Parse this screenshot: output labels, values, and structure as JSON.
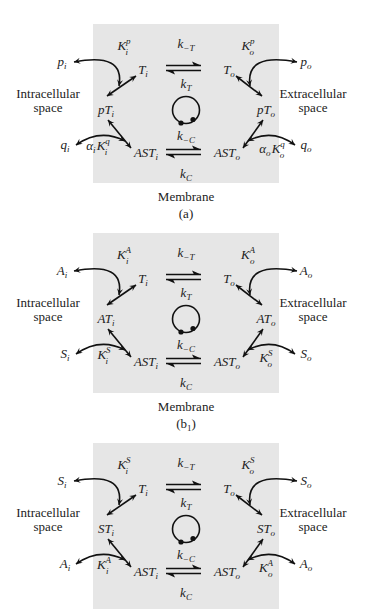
{
  "colors": {
    "membrane": "#e6e6e6",
    "ink": "#111111",
    "text": "#222222"
  },
  "panels": [
    {
      "id": "a",
      "box": {
        "x": 93,
        "y": 24,
        "w": 186,
        "h": 159
      },
      "caption": {
        "membrane": "Membrane",
        "label": "(a)"
      },
      "regions": {
        "left": [
          "Intracellular",
          "space"
        ],
        "right": [
          "Extracellular",
          "space"
        ]
      },
      "states": {
        "Ti": {
          "main": "T",
          "sub": "i"
        },
        "To": {
          "main": "T",
          "sub": "o"
        },
        "boundI": {
          "main": "pT",
          "sub": "i"
        },
        "boundO": {
          "main": "pT",
          "sub": "o"
        },
        "ASTi": {
          "main": "AST",
          "sub": "i"
        },
        "ASTo": {
          "main": "AST",
          "sub": "o"
        }
      },
      "ligands": {
        "topI": {
          "main": "p",
          "sub": "i"
        },
        "topO": {
          "main": "p",
          "sub": "o"
        },
        "botI": {
          "main": "q",
          "sub": "i"
        },
        "botO": {
          "main": "q",
          "sub": "o"
        }
      },
      "constants": {
        "topI": {
          "pre": "",
          "main": "K",
          "sup": "p",
          "sub": "i"
        },
        "topO": {
          "pre": "",
          "main": "K",
          "sup": "p",
          "sub": "o"
        },
        "botI": {
          "pre": "α",
          "presub": "i",
          "main": "K",
          "sup": "q",
          "sub": "i"
        },
        "botO": {
          "pre": "α",
          "presub": "o",
          "main": "K",
          "sup": "q",
          "sub": "o"
        }
      },
      "rates": {
        "kmT": {
          "main": "k",
          "sub": "−T"
        },
        "kT": {
          "main": "k",
          "sub": "T"
        },
        "kmC": {
          "main": "k",
          "sub": "−C"
        },
        "kC": {
          "main": "k",
          "sub": "C"
        }
      }
    },
    {
      "id": "b1",
      "box": {
        "x": 93,
        "y": 233,
        "w": 186,
        "h": 160
      },
      "caption": {
        "membrane": "Membrane",
        "label": "(b",
        "label_sub": "1",
        "label_end": ")"
      },
      "regions": {
        "left": [
          "Intracellular",
          "space"
        ],
        "right": [
          "Extracellular",
          "space"
        ]
      },
      "states": {
        "Ti": {
          "main": "T",
          "sub": "i"
        },
        "To": {
          "main": "T",
          "sub": "o"
        },
        "boundI": {
          "main": "AT",
          "sub": "i"
        },
        "boundO": {
          "main": "AT",
          "sub": "o"
        },
        "ASTi": {
          "main": "AST",
          "sub": "i"
        },
        "ASTo": {
          "main": "AST",
          "sub": "o"
        }
      },
      "ligands": {
        "topI": {
          "main": "A",
          "sub": "i"
        },
        "topO": {
          "main": "A",
          "sub": "o"
        },
        "botI": {
          "main": "S",
          "sub": "i"
        },
        "botO": {
          "main": "S",
          "sub": "o"
        }
      },
      "constants": {
        "topI": {
          "pre": "",
          "main": "K",
          "sup": "A",
          "sub": "i"
        },
        "topO": {
          "pre": "",
          "main": "K",
          "sup": "A",
          "sub": "o"
        },
        "botI": {
          "pre": "",
          "main": "K",
          "sup": "S",
          "sub": "i"
        },
        "botO": {
          "pre": "",
          "main": "K",
          "sup": "S",
          "sub": "o"
        }
      },
      "rates": {
        "kmT": {
          "main": "k",
          "sub": "−T"
        },
        "kT": {
          "main": "k",
          "sub": "T"
        },
        "kmC": {
          "main": "k",
          "sub": "−C"
        },
        "kC": {
          "main": "k",
          "sub": "C"
        }
      }
    },
    {
      "id": "b2",
      "box": {
        "x": 93,
        "y": 443,
        "w": 186,
        "h": 166
      },
      "caption": null,
      "regions": {
        "left": [
          "Intracellular",
          "space"
        ],
        "right": [
          "Extracellular",
          "space"
        ]
      },
      "states": {
        "Ti": {
          "main": "T",
          "sub": "i"
        },
        "To": {
          "main": "T",
          "sub": "o"
        },
        "boundI": {
          "main": "ST",
          "sub": "i"
        },
        "boundO": {
          "main": "ST",
          "sub": "o"
        },
        "ASTi": {
          "main": "AST",
          "sub": "i"
        },
        "ASTo": {
          "main": "AST",
          "sub": "o"
        }
      },
      "ligands": {
        "topI": {
          "main": "S",
          "sub": "i"
        },
        "topO": {
          "main": "S",
          "sub": "o"
        },
        "botI": {
          "main": "A",
          "sub": "i"
        },
        "botO": {
          "main": "A",
          "sub": "o"
        }
      },
      "constants": {
        "topI": {
          "pre": "",
          "main": "K",
          "sup": "S",
          "sub": "i"
        },
        "topO": {
          "pre": "",
          "main": "K",
          "sup": "S",
          "sub": "o"
        },
        "botI": {
          "pre": "",
          "main": "K",
          "sup": "A",
          "sub": "i"
        },
        "botO": {
          "pre": "",
          "main": "K",
          "sup": "A",
          "sub": "o"
        }
      },
      "rates": {
        "kmT": {
          "main": "k",
          "sub": "−T"
        },
        "kT": {
          "main": "k",
          "sub": "T"
        },
        "kmC": {
          "main": "k",
          "sub": "−C"
        },
        "kC": {
          "main": "k",
          "sub": "C"
        }
      }
    }
  ]
}
